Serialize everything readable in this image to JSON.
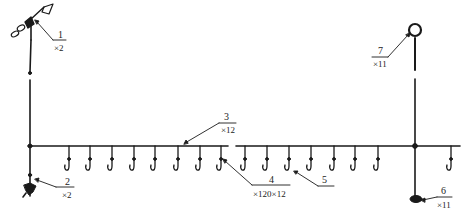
{
  "diagram": {
    "colors": {
      "ink": "#1a1a1a",
      "background": "#ffffff"
    },
    "main_line": {
      "y": 146,
      "segments": [
        [
          28,
          228
        ],
        [
          236,
          460
        ]
      ]
    },
    "posts": [
      {
        "name": "left-post",
        "x": 30,
        "top": 22,
        "bottom": 196
      },
      {
        "name": "right-post",
        "x": 415,
        "top": 30,
        "bottom": 205
      }
    ],
    "hooks": {
      "left": [
        69,
        90,
        112,
        134,
        155,
        178,
        200,
        221
      ],
      "right": [
        245,
        267,
        289,
        311,
        334,
        355,
        378,
        451
      ]
    },
    "labels": [
      {
        "id": "label-1",
        "num": "1",
        "qty": "×2",
        "x": 41,
        "line_y": 52
      },
      {
        "id": "label-2",
        "num": "2",
        "qty": "×2",
        "x": 67,
        "line_y": 187
      },
      {
        "id": "label-3",
        "num": "3",
        "qty": "×12",
        "x": 225,
        "line_y": 123
      },
      {
        "id": "label-4",
        "num": "4",
        "qty": "×120×12",
        "x": 255,
        "line_y": 185
      },
      {
        "id": "label-5",
        "num": "5",
        "qty": "",
        "x": 324,
        "line_y": 187
      },
      {
        "id": "label-6",
        "num": "6",
        "qty": "×11",
        "x": 441,
        "line_y": 196
      },
      {
        "id": "label-7",
        "num": "7",
        "qty": "×11",
        "x": 377,
        "line_y": 57
      }
    ]
  }
}
